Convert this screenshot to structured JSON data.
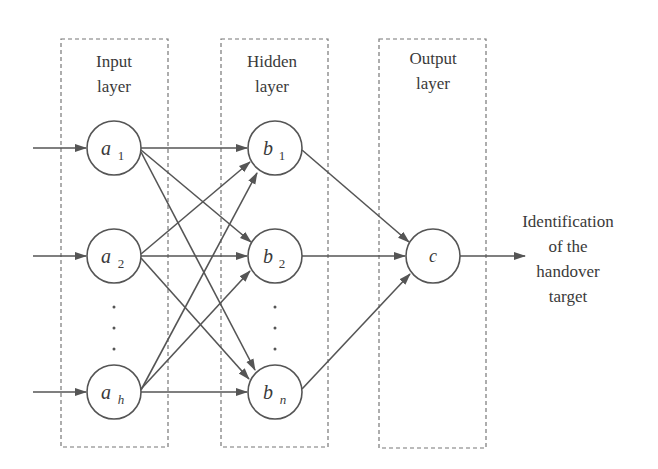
{
  "colors": {
    "stroke": "#555555",
    "dash_box": "#777777",
    "text": "#3a3a3a",
    "background": "#ffffff"
  },
  "layers": [
    {
      "id": "input",
      "title_line1": "Input",
      "title_line2": "layer"
    },
    {
      "id": "hidden",
      "title_line1": "Hidden",
      "title_line2": "layer"
    },
    {
      "id": "output",
      "title_line1": "Output",
      "title_line2": "layer"
    }
  ],
  "nodes": {
    "a1": {
      "base": "a",
      "sub": "1"
    },
    "a2": {
      "base": "a",
      "sub": "2"
    },
    "ah": {
      "base": "a",
      "sub": "h"
    },
    "b1": {
      "base": "b",
      "sub": "1"
    },
    "b2": {
      "base": "b",
      "sub": "2"
    },
    "bn": {
      "base": "b",
      "sub": "n"
    },
    "c": {
      "base": "c",
      "sub": ""
    }
  },
  "ellipsis": "·",
  "output_label": {
    "line1": "Identification",
    "line2": "of the",
    "line3": "handover",
    "line4": "target"
  },
  "connections": [
    [
      "in",
      "a1"
    ],
    [
      "in",
      "a2"
    ],
    [
      "in",
      "ah"
    ],
    [
      "a1",
      "b1"
    ],
    [
      "a1",
      "b2"
    ],
    [
      "a1",
      "bn"
    ],
    [
      "a2",
      "b1"
    ],
    [
      "a2",
      "b2"
    ],
    [
      "a2",
      "bn"
    ],
    [
      "ah",
      "b1"
    ],
    [
      "ah",
      "b2"
    ],
    [
      "ah",
      "bn"
    ],
    [
      "b1",
      "c"
    ],
    [
      "b2",
      "c"
    ],
    [
      "bn",
      "c"
    ],
    [
      "c",
      "out"
    ]
  ]
}
